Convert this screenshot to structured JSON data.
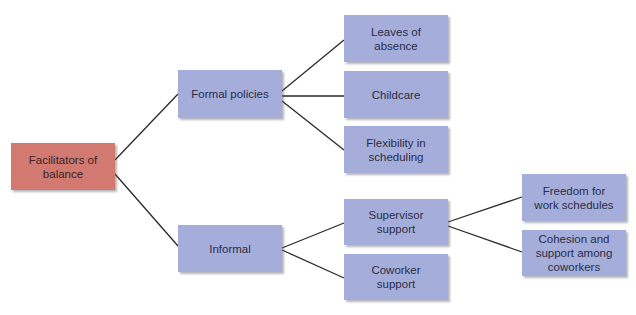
{
  "colors": {
    "root_fill": "#d27a72",
    "node_fill": "#a5addb",
    "line": "#2a2a2a",
    "text": "#2a2e48"
  },
  "diagram": {
    "root": {
      "label": "Facilitators of balance"
    },
    "branches": [
      {
        "label": "Formal policies",
        "children": [
          {
            "label": "Leaves of absence"
          },
          {
            "label": "Childcare"
          },
          {
            "label": "Flexibility in scheduling"
          }
        ]
      },
      {
        "label": "Informal",
        "children": [
          {
            "label": "Supervisor support",
            "children": [
              {
                "label": "Freedom for work schedules"
              },
              {
                "label": "Cohesion and support among coworkers"
              }
            ]
          },
          {
            "label": "Coworker support"
          }
        ]
      }
    ]
  }
}
